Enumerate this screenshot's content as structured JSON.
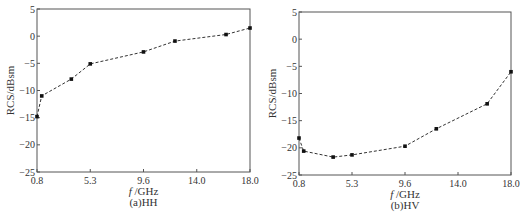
{
  "chart_data": [
    {
      "type": "line",
      "title": "",
      "caption": "(a)HH",
      "xlabel": "f /GHz",
      "ylabel": "RCS/dBsm",
      "xticks": [
        "0.8",
        "5.3",
        "9.6",
        "14.0",
        "18.0"
      ],
      "yticks": [
        "5",
        "0",
        "-5",
        "-10",
        "-15",
        "-20",
        "-25"
      ],
      "ylim": [
        -25,
        5
      ],
      "grid": false,
      "line_style": "dashed",
      "marker": "square",
      "x": [
        0.8,
        1.2,
        3.7,
        5.3,
        9.6,
        12.2,
        16.2,
        18.0
      ],
      "values": [
        -14.8,
        -11.0,
        -7.9,
        -5.1,
        -2.9,
        -0.9,
        0.3,
        1.5
      ]
    },
    {
      "type": "line",
      "title": "",
      "caption": "(b)HV",
      "xlabel": "f /GHz",
      "ylabel": "RCS/dBsm",
      "xticks": [
        "0.8",
        "5.3",
        "9.6",
        "14.0",
        "18.0"
      ],
      "yticks": [
        "5",
        "0",
        "-5",
        "-10",
        "-15",
        "-20",
        "-25"
      ],
      "ylim": [
        -25,
        5
      ],
      "grid": false,
      "line_style": "dashed",
      "marker": "square",
      "x": [
        0.8,
        1.2,
        3.7,
        5.3,
        9.6,
        12.2,
        16.2,
        18.0
      ],
      "values": [
        -18.2,
        -20.6,
        -21.7,
        -21.3,
        -19.7,
        -16.5,
        -11.9,
        -6.0
      ]
    }
  ],
  "colors": {
    "axis": "#555555",
    "line": "#333333",
    "marker": "#111111"
  }
}
